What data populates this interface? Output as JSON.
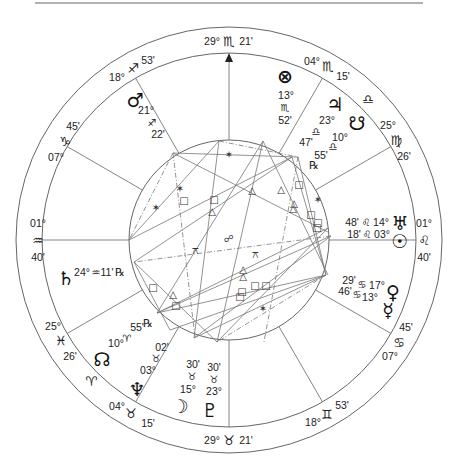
{
  "chart": {
    "type": "natal-wheel",
    "center": [
      229,
      240
    ],
    "radii": {
      "outer": 213,
      "house_ring": 187,
      "aspect_circle": 100
    },
    "colors": {
      "line": "#555555",
      "text": "#222222",
      "background": "#ffffff"
    },
    "angles": {
      "mc": {
        "deg": "29°",
        "sign": "♏",
        "min": "21'"
      },
      "ic": {
        "deg": "29°",
        "sign": "♉",
        "min": "21'"
      },
      "asc": {
        "deg": "01°",
        "sign": "♒",
        "min": "40'"
      },
      "dsc": {
        "deg": "01°",
        "sign": "♌",
        "min": "40'"
      }
    },
    "cusps": [
      {
        "id": "c11",
        "deg": "04°",
        "sign": "♏",
        "min": "15'"
      },
      {
        "id": "c12_sign_only",
        "sign": "♎"
      },
      {
        "id": "c12",
        "deg": "25°",
        "sign": "♍",
        "min": "26'"
      },
      {
        "id": "c2",
        "deg": "07°",
        "sign": "♋",
        "min": "45'"
      },
      {
        "id": "c3",
        "deg": "18°",
        "sign": "♊",
        "min": "53'"
      },
      {
        "id": "c5",
        "deg": "04°",
        "sign": "♉",
        "min": "15'"
      },
      {
        "id": "c5_sign_only",
        "sign": "♈"
      },
      {
        "id": "c6",
        "deg": "25°",
        "sign": "♓",
        "min": "26'"
      },
      {
        "id": "c8",
        "deg": "07°",
        "sign": "♑",
        "min": "45'"
      },
      {
        "id": "c9",
        "deg": "18°",
        "sign": "♐",
        "min": "53'"
      }
    ],
    "planets": [
      {
        "name": "Mars",
        "glyph": "♂",
        "deg": "21°",
        "sign": "♐",
        "min": "22'"
      },
      {
        "name": "Part of Fortune",
        "glyph": "⊗",
        "deg": "13°",
        "sign": "♏",
        "min": "52'"
      },
      {
        "name": "Jupiter",
        "glyph": "♃",
        "deg": "23°",
        "sign": "♎",
        "min": "47'"
      },
      {
        "name": "South Node",
        "glyph": "☋",
        "deg": "10°",
        "sign": "♎",
        "min": "55'",
        "retro": "℞"
      },
      {
        "name": "Uranus",
        "glyph": "♅",
        "deg": "14°",
        "sign": "♌",
        "min": "48'"
      },
      {
        "name": "Sun",
        "glyph": "☉",
        "deg": "03°",
        "sign": "♌",
        "min": "18'"
      },
      {
        "name": "Venus",
        "glyph": "♀",
        "deg": "17°",
        "sign": "♋",
        "min": "29'"
      },
      {
        "name": "Mercury",
        "glyph": "☿",
        "deg": "13°",
        "sign": "♋",
        "min": "46'"
      },
      {
        "name": "Saturn",
        "glyph": "♄",
        "deg": "24°",
        "sign": "♒",
        "min": "11'",
        "retro": "℞"
      },
      {
        "name": "North Node",
        "glyph": "☊",
        "deg": "10°",
        "sign": "♈",
        "min": "55'",
        "retro": "℞"
      },
      {
        "name": "Neptune",
        "glyph": "♆",
        "deg": "03°",
        "sign": "♉",
        "min": "02'"
      },
      {
        "name": "Moon",
        "glyph": "☽",
        "deg": "15°",
        "sign": "♉",
        "min": "30'"
      },
      {
        "name": "Pluto",
        "glyph": "♇",
        "deg": "23°",
        "sign": "♉",
        "min": "30'"
      }
    ],
    "aspect_glyphs": {
      "trine": "△",
      "square": "□",
      "sextile": "✶",
      "quincunx": "⚻",
      "opposition": "☍"
    }
  }
}
